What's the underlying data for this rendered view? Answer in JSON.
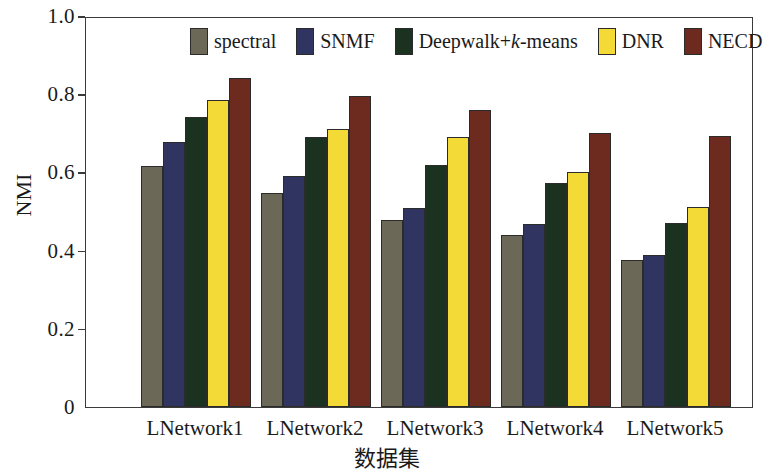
{
  "chart_data": {
    "type": "bar",
    "title": "",
    "xlabel": "数据集",
    "ylabel": "NMI",
    "categories": [
      "LNetwork1",
      "LNetwork2",
      "LNetwork3",
      "LNetwork4",
      "LNetwork5"
    ],
    "ylim": [
      0,
      1.0
    ],
    "yticks": [
      "0",
      "0.2",
      "0.4",
      "0.6",
      "0.8",
      "1.0"
    ],
    "ytick_values": [
      0,
      0.2,
      0.4,
      0.6,
      0.8,
      1.0
    ],
    "grid": false,
    "legend_position": "top-center",
    "series": [
      {
        "name": "spectral",
        "color": "#6b6857",
        "values": [
          0.617,
          0.547,
          0.478,
          0.44,
          0.377
        ]
      },
      {
        "name": "SNMF",
        "color": "#2f3560",
        "values": [
          0.678,
          0.59,
          0.51,
          0.468,
          0.389
        ]
      },
      {
        "name": "Deepwalk+k-means",
        "name_prefix": "Deepwalk+",
        "name_italic": "k",
        "name_suffix": "-means",
        "color": "#1b3220",
        "values": [
          0.741,
          0.69,
          0.62,
          0.574,
          0.47
        ]
      },
      {
        "name": "DNR",
        "color": "#f3da36",
        "values": [
          0.784,
          0.711,
          0.69,
          0.602,
          0.511
        ]
      },
      {
        "name": "NECD",
        "color": "#6d2a1f",
        "values": [
          0.842,
          0.796,
          0.76,
          0.7,
          0.694
        ]
      }
    ]
  },
  "figure": {
    "axis_color": "#3a3a3a",
    "bar_edge_color": "#2b2b2b",
    "background": "#ffffff"
  }
}
